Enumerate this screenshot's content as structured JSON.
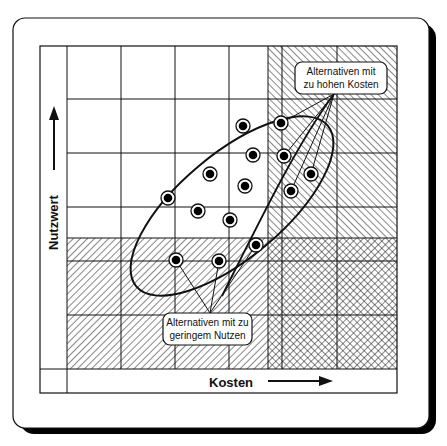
{
  "diagram": {
    "y_axis_label": "Nutzwert",
    "x_axis_label": "Kosten",
    "callouts": {
      "high_cost": {
        "line1": "Alternativen mit",
        "line2": "zu hohen Kosten"
      },
      "low_benefit": {
        "line1": "Alternativen mit zu",
        "line2": "geringem Nutzen"
      }
    },
    "regions": [
      {
        "name": "acceptable",
        "pattern": "none"
      },
      {
        "name": "too-high-cost",
        "pattern": "back-diagonal hatch"
      },
      {
        "name": "too-low-benefit",
        "pattern": "forward-diagonal hatch"
      },
      {
        "name": "both",
        "pattern": "cross-hatch"
      }
    ],
    "points": [
      {
        "x": 243,
        "y": 126
      },
      {
        "x": 281,
        "y": 123
      },
      {
        "x": 284,
        "y": 156
      },
      {
        "x": 253,
        "y": 155
      },
      {
        "x": 210,
        "y": 174
      },
      {
        "x": 245,
        "y": 186
      },
      {
        "x": 311,
        "y": 174
      },
      {
        "x": 168,
        "y": 198
      },
      {
        "x": 198,
        "y": 211
      },
      {
        "x": 291,
        "y": 191
      },
      {
        "x": 230,
        "y": 220
      },
      {
        "x": 256,
        "y": 245
      },
      {
        "x": 176,
        "y": 260
      },
      {
        "x": 219,
        "y": 261
      }
    ],
    "colors": {
      "ink": "#111111",
      "paper": "#ffffff"
    }
  }
}
